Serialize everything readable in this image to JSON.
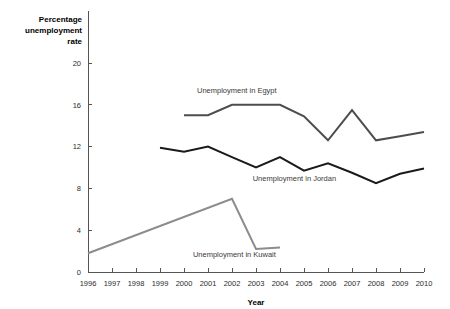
{
  "chart_data": {
    "type": "line",
    "title": "",
    "xlabel": "Year",
    "ylabel": "Percentage unemployment rate",
    "ylabel_lines": [
      "Percentage",
      "unemployment",
      "rate"
    ],
    "x": [
      1996,
      1997,
      1998,
      1999,
      2000,
      2001,
      2002,
      2003,
      2004,
      2005,
      2006,
      2007,
      2008,
      2009,
      2010
    ],
    "categories": [
      "1996",
      "1997",
      "1998",
      "1999",
      "2000",
      "2001",
      "2002",
      "2003",
      "2004",
      "2005",
      "2006",
      "2007",
      "2008",
      "2009",
      "2010"
    ],
    "xlim": [
      1996,
      2010
    ],
    "ylim": [
      0,
      20
    ],
    "yticks": [
      0,
      4,
      8,
      12,
      16,
      20
    ],
    "ytick_labels": [
      "0",
      "4",
      "8",
      "12",
      "16",
      "20"
    ],
    "grid": false,
    "legend": "inline-labels",
    "series": [
      {
        "name": "Unemployment in Egypt",
        "label": "Unemployment in Egypt",
        "color": "#4d4d4d",
        "stroke_width": 2,
        "label_x": 2002.2,
        "label_y": 17.1,
        "x": [
          2000,
          2001,
          2002,
          2003,
          2004,
          2005,
          2006,
          2007,
          2008,
          2009,
          2010
        ],
        "values": [
          15.0,
          15.0,
          16.0,
          16.0,
          16.0,
          14.9,
          12.6,
          15.5,
          12.6,
          13.0,
          13.4
        ]
      },
      {
        "name": "Unemployment in Jordan",
        "label": "Unemployment in Jordan",
        "color": "#1a1a1a",
        "stroke_width": 2,
        "label_x": 2004.6,
        "label_y": 8.7,
        "x": [
          1999,
          2000,
          2001,
          2002,
          2003,
          2004,
          2005,
          2006,
          2007,
          2008,
          2009,
          2010
        ],
        "values": [
          11.9,
          11.5,
          12.0,
          11.0,
          10.0,
          11.0,
          9.7,
          10.4,
          9.5,
          8.5,
          9.4,
          9.9
        ]
      },
      {
        "name": "Unemployment in Kuwait",
        "label": "Unemployment in Kuwait",
        "color": "#8c8c8c",
        "stroke_width": 2,
        "label_x": 2002.1,
        "label_y": 1.45,
        "x": [
          1996,
          2002,
          2003,
          2004
        ],
        "values": [
          1.8,
          7.0,
          2.2,
          2.35
        ]
      }
    ]
  }
}
